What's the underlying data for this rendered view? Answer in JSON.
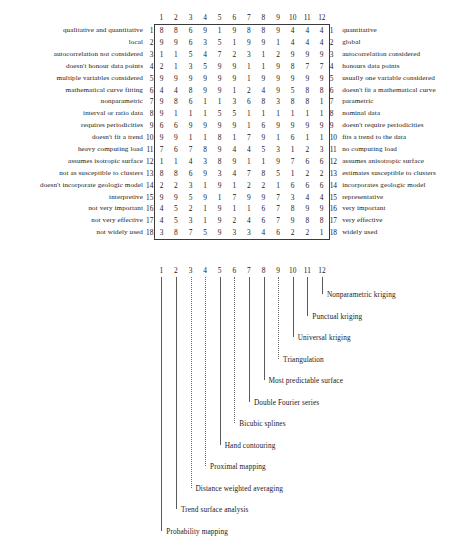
{
  "matrix": {
    "column_headers": [
      "1",
      "2",
      "3",
      "4",
      "5",
      "6",
      "7",
      "8",
      "9",
      "10",
      "11",
      "12"
    ],
    "row_numbers": [
      "1",
      "2",
      "3",
      "4",
      "5",
      "6",
      "7",
      "8",
      "9",
      "10",
      "11",
      "12",
      "13",
      "14",
      "15",
      "16",
      "17",
      "18"
    ],
    "left_labels": [
      "qualitative and quantitative",
      "local",
      "autocorrelation not considered",
      "doesn't honour data points",
      "multiple variables considered",
      "mathematical curve fitting",
      "nonparametric",
      "interval or ratio data",
      "requires periodicities",
      "doesn't fit a trend",
      "heavy computing load",
      "assumes isotropic surface",
      "not as susceptible to clusters",
      "doesn't incorporate geologic model",
      "interpretive",
      "not very important",
      "not very effective",
      "not widely used"
    ],
    "right_labels": [
      "quantitative",
      "global",
      "autocorrelation considered",
      "honours data points",
      "usually one variable considered",
      "doesn't fit a mathematical curve",
      "parametric",
      "nominal data",
      "doesn't require periodicities",
      "fits a trend to the data",
      "no computing load",
      "assumes anisotropic surface",
      "estimates susceptible to clusters",
      "incorporates geologic model",
      "representative",
      "very important",
      "very effective",
      "widely used"
    ],
    "values": [
      [
        8,
        8,
        6,
        9,
        1,
        9,
        8,
        8,
        9,
        4,
        4,
        4
      ],
      [
        9,
        9,
        6,
        3,
        5,
        1,
        9,
        9,
        1,
        4,
        4,
        4
      ],
      [
        1,
        1,
        5,
        4,
        7,
        2,
        3,
        1,
        2,
        9,
        9,
        9
      ],
      [
        2,
        1,
        3,
        5,
        9,
        9,
        1,
        1,
        9,
        8,
        7,
        7
      ],
      [
        9,
        9,
        9,
        9,
        9,
        9,
        1,
        9,
        9,
        9,
        9,
        9
      ],
      [
        4,
        4,
        8,
        9,
        9,
        1,
        2,
        4,
        9,
        5,
        8,
        8
      ],
      [
        9,
        8,
        6,
        1,
        1,
        3,
        6,
        8,
        3,
        8,
        8,
        1
      ],
      [
        9,
        1,
        1,
        1,
        5,
        5,
        1,
        1,
        1,
        1,
        1,
        1
      ],
      [
        6,
        6,
        9,
        9,
        9,
        9,
        1,
        6,
        9,
        9,
        9,
        9
      ],
      [
        9,
        9,
        1,
        1,
        8,
        1,
        7,
        9,
        1,
        6,
        1,
        1
      ],
      [
        7,
        6,
        7,
        8,
        9,
        4,
        4,
        5,
        3,
        1,
        2,
        3
      ],
      [
        1,
        1,
        4,
        3,
        8,
        9,
        1,
        1,
        9,
        7,
        6,
        6
      ],
      [
        8,
        8,
        6,
        9,
        3,
        4,
        7,
        8,
        5,
        1,
        2,
        2
      ],
      [
        2,
        2,
        3,
        1,
        9,
        1,
        2,
        2,
        1,
        6,
        6,
        6
      ],
      [
        9,
        9,
        5,
        9,
        1,
        7,
        9,
        9,
        7,
        3,
        4,
        4
      ],
      [
        4,
        5,
        2,
        1,
        9,
        1,
        1,
        6,
        7,
        8,
        9,
        9
      ],
      [
        4,
        5,
        3,
        1,
        9,
        2,
        4,
        6,
        7,
        9,
        8,
        8
      ],
      [
        3,
        8,
        7,
        5,
        9,
        3,
        3,
        4,
        6,
        2,
        2,
        1
      ]
    ]
  },
  "legend": {
    "column_indices": [
      "1",
      "2",
      "3",
      "4",
      "5",
      "6",
      "7",
      "8",
      "9",
      "10",
      "11",
      "12"
    ],
    "methods": [
      {
        "index": "1",
        "label": "Probability mapping"
      },
      {
        "index": "2",
        "label": "Trend surface analysis"
      },
      {
        "index": "3",
        "label": "Distance weighted averaging"
      },
      {
        "index": "4",
        "label": "Proximal mapping"
      },
      {
        "index": "5",
        "label": "Hand contouring"
      },
      {
        "index": "6",
        "label": "Bicubic splines"
      },
      {
        "index": "7",
        "label": "Double Fourier series"
      },
      {
        "index": "8",
        "label": "Most predictable surface"
      },
      {
        "index": "9",
        "label": "Triangulation"
      },
      {
        "index": "10",
        "label": "Universal kriging"
      },
      {
        "index": "11",
        "label": "Punctual kriging"
      },
      {
        "index": "12",
        "label": "Nonparametric kriging"
      }
    ]
  },
  "colors": {
    "ink": "#1a1a1a",
    "rule": "#3b3b3b",
    "leader": "#5a5a5a",
    "background": "#ffffff"
  }
}
